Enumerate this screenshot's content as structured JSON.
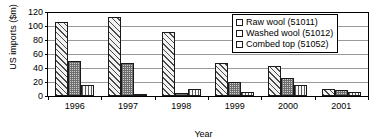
{
  "chart_data": {
    "type": "bar",
    "title": "",
    "xlabel": "Year",
    "ylabel": "US imports ($m)",
    "ylim": [
      0,
      120
    ],
    "ytick_step": 20,
    "yticks": [
      0,
      20,
      40,
      60,
      80,
      100,
      120
    ],
    "grid": true,
    "legend_position": "top-right",
    "categories": [
      "1996",
      "1997",
      "1998",
      "1999",
      "2000",
      "2001"
    ],
    "series": [
      {
        "name": "Raw wool (51011)",
        "pattern": "diagonal-hatch",
        "values": [
          104,
          112,
          90,
          46,
          42,
          9
        ]
      },
      {
        "name": "Washed wool (51012)",
        "pattern": "dense-grid",
        "values": [
          49,
          46,
          3,
          19,
          25,
          7.5
        ]
      },
      {
        "name": "Combed top (51052)",
        "pattern": "vertical-lines",
        "values": [
          14,
          1.5,
          8.5,
          5,
          14,
          4
        ]
      }
    ]
  },
  "colors": {
    "axis": "#000000",
    "gridline": "#9a9a9a",
    "background": "#ffffff",
    "bar_outline": "#1a1a1a"
  }
}
